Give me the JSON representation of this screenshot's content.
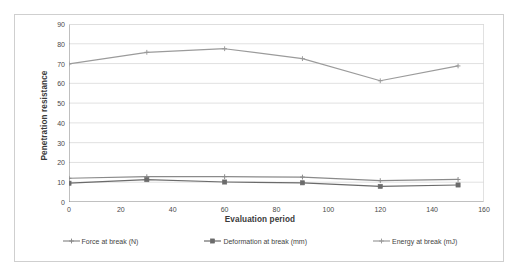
{
  "chart_data": {
    "type": "line",
    "title": "",
    "xlabel": "Evaluation period",
    "ylabel": "Penetration resistance",
    "x": [
      0,
      30,
      60,
      90,
      120,
      150
    ],
    "xlim": [
      0,
      160
    ],
    "ylim": [
      0,
      90
    ],
    "x_ticks": [
      0,
      20,
      40,
      60,
      80,
      100,
      120,
      140,
      160
    ],
    "y_ticks": [
      0,
      10,
      20,
      30,
      40,
      50,
      60,
      70,
      80,
      90
    ],
    "grid": "horizontal",
    "legend_position": "bottom",
    "series": [
      {
        "name": "Force at break (N)",
        "color": "#8a8a8a",
        "marker": "cross",
        "values": [
          12.0,
          12.8,
          12.8,
          12.6,
          10.8,
          11.4
        ]
      },
      {
        "name": "Deformation at break (mm)",
        "color": "#6b6b6b",
        "marker": "square",
        "values": [
          9.5,
          11.3,
          10.1,
          9.7,
          7.9,
          8.6
        ]
      },
      {
        "name": "Energy at break (mJ)",
        "color": "#9b9b9b",
        "marker": "cross",
        "values": [
          69.8,
          75.7,
          77.5,
          72.5,
          61.3,
          68.8
        ]
      }
    ]
  },
  "axes": {
    "y_tick_labels": [
      "0",
      "10",
      "20",
      "30",
      "40",
      "50",
      "60",
      "70",
      "80",
      "90"
    ],
    "x_tick_labels": [
      "0",
      "20",
      "40",
      "60",
      "80",
      "100",
      "120",
      "140",
      "160"
    ],
    "y_title": "Penetration resistance",
    "x_title": "Evaluation period"
  },
  "legend": {
    "items": [
      {
        "label": "Force at break (N)"
      },
      {
        "label": "Deformation at break (mm)"
      },
      {
        "label": "Energy at break (mJ)"
      }
    ]
  },
  "colors": {
    "frame": "#cfcfcf",
    "axis": "#808080",
    "grid": "#d9d9d9",
    "text": "#4a4a4a"
  }
}
